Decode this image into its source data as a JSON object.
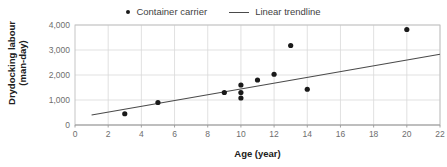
{
  "chart_data": {
    "type": "scatter",
    "title": "",
    "xlabel": "Age (year)",
    "ylabel": "Drydocking labour (man-day)",
    "ylabel_line1": "Drydocking labour",
    "ylabel_line2": "(man-day)",
    "xlim": [
      0,
      22
    ],
    "ylim": [
      0,
      4000
    ],
    "xticks": [
      0,
      2,
      4,
      6,
      8,
      10,
      12,
      14,
      16,
      18,
      20,
      22
    ],
    "xtick_labels": [
      "0",
      "2",
      "4",
      "6",
      "8",
      "10",
      "12",
      "14",
      "16",
      "18",
      "20",
      "22"
    ],
    "yticks": [
      0,
      1000,
      2000,
      3000,
      4000
    ],
    "ytick_labels": [
      "0",
      "1,000",
      "2,000",
      "3,000",
      "4,000"
    ],
    "grid": true,
    "legend_position": "top-center",
    "series": [
      {
        "name": "Container carrier",
        "type": "scatter",
        "marker": "circle",
        "color": "#1a1a1a",
        "points": [
          {
            "x": 3,
            "y": 450
          },
          {
            "x": 5,
            "y": 900
          },
          {
            "x": 9,
            "y": 1300
          },
          {
            "x": 10,
            "y": 1600
          },
          {
            "x": 10,
            "y": 1300
          },
          {
            "x": 10,
            "y": 1080
          },
          {
            "x": 11,
            "y": 1800
          },
          {
            "x": 12,
            "y": 2030
          },
          {
            "x": 13,
            "y": 3180
          },
          {
            "x": 14,
            "y": 1430
          },
          {
            "x": 20,
            "y": 3820
          }
        ]
      },
      {
        "name": "Linear trendline",
        "type": "line",
        "color": "#4a4a4a",
        "points": [
          {
            "x": 1,
            "y": 400
          },
          {
            "x": 22,
            "y": 2830
          }
        ]
      }
    ]
  },
  "legend": {
    "entries": [
      {
        "label": "Container carrier",
        "marker": "scatter-dot-icon"
      },
      {
        "label": "Linear trendline",
        "marker": "line-segment-icon"
      }
    ]
  },
  "axes": {
    "x_title": "Age (year)",
    "y_title_line1": "Drydocking labour",
    "y_title_line2": "(man-day)"
  }
}
